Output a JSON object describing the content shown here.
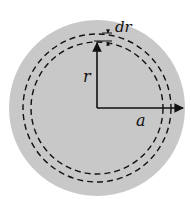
{
  "diagram": {
    "colors": {
      "disc_fill": "#c8c8c8",
      "lines": "#111111",
      "background": "#ffffff"
    },
    "labels": {
      "ring_width": "dr",
      "ring_radius": "r",
      "disc_radius": "a"
    },
    "geometry": {
      "center": [
        97,
        108
      ],
      "disc_radius_px": 88,
      "ring_inner_radius_px": 66,
      "ring_outer_radius_px": 74
    }
  }
}
